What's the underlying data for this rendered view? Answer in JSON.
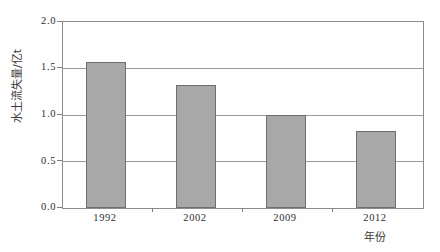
{
  "chart_data": {
    "type": "bar",
    "title": "",
    "xlabel": "年份",
    "ylabel": "水土流失量/亿t",
    "categories": [
      "1992",
      "2002",
      "2009",
      "2012"
    ],
    "values": [
      1.57,
      1.32,
      1.0,
      0.83
    ],
    "series": [
      {
        "name": "水土流失量",
        "values": [
          1.57,
          1.32,
          1.0,
          0.83
        ]
      }
    ],
    "ylim": [
      0.0,
      2.0
    ],
    "ytick_labels": [
      "0.0",
      "0.5",
      "1.0",
      "1.5",
      "2.0"
    ],
    "ytick_values": [
      0.0,
      0.5,
      1.0,
      1.5,
      2.0
    ],
    "grid": true,
    "legend": "none",
    "bar_color": "#a8a8a8",
    "bar_border_color": "#6f6f6f",
    "axis_color": "#8c8c8c",
    "grid_color": "#9a9a9a",
    "background": "#fefefe"
  }
}
